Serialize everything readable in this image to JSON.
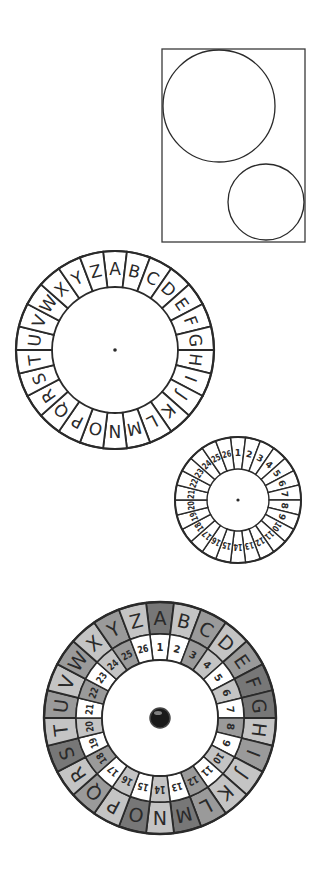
{
  "colors": {
    "ink": "#2a2a2a",
    "background": "#ffffff",
    "shade_light": "#c4c4c4",
    "shade_mid": "#9a9a9a",
    "shade_dark": "#777777",
    "hub": "#ffffff"
  },
  "layout_guide": {
    "rect": {
      "x": 162,
      "y": 49,
      "w": 143,
      "h": 193
    },
    "large_circle": {
      "cx": 219,
      "cy": 106,
      "r": 56
    },
    "small_circle": {
      "cx": 266,
      "cy": 202,
      "r": 38
    }
  },
  "letter_wheel": {
    "cx": 115,
    "cy": 350,
    "r_outer": 99,
    "r_inner": 63,
    "center_dot": true,
    "labels": [
      "A",
      "B",
      "C",
      "D",
      "E",
      "F",
      "G",
      "H",
      "I",
      "J",
      "K",
      "L",
      "M",
      "N",
      "O",
      "P",
      "Q",
      "R",
      "S",
      "T",
      "U",
      "V",
      "W",
      "X",
      "Y",
      "Z"
    ]
  },
  "number_wheel": {
    "cx": 238,
    "cy": 500,
    "r_outer": 63,
    "r_inner": 31,
    "center_dot": true,
    "labels": [
      "1",
      "2",
      "3",
      "4",
      "5",
      "6",
      "7",
      "8",
      "9",
      "10",
      "11",
      "12",
      "13",
      "14",
      "15",
      "16",
      "17",
      "18",
      "19",
      "20",
      "21",
      "22",
      "23",
      "24",
      "25",
      "26"
    ]
  },
  "assembled_wheel": {
    "cx": 160,
    "cy": 718,
    "outer": {
      "r_outer": 116,
      "r_inner": 84,
      "labels": [
        "A",
        "B",
        "C",
        "D",
        "E",
        "F",
        "G",
        "H",
        "I",
        "J",
        "K",
        "L",
        "M",
        "N",
        "O",
        "P",
        "Q",
        "R",
        "S",
        "T",
        "U",
        "V",
        "W",
        "X",
        "Y",
        "Z"
      ]
    },
    "inner": {
      "r_outer": 84,
      "r_inner": 58,
      "labels": [
        "1",
        "2",
        "3",
        "4",
        "5",
        "6",
        "7",
        "8",
        "9",
        "10",
        "11",
        "12",
        "13",
        "14",
        "15",
        "16",
        "17",
        "18",
        "19",
        "20",
        "21",
        "22",
        "23",
        "24",
        "25",
        "26"
      ]
    },
    "hub_radius": 58,
    "pin_radius": 10,
    "outer_shades": [
      "dark",
      "light",
      "mid",
      "light",
      "mid",
      "dark",
      "dark",
      "light",
      "mid",
      "light",
      "light",
      "mid",
      "dark",
      "light",
      "dark",
      "light",
      "mid",
      "light",
      "dark",
      "light",
      "mid",
      "light",
      "mid",
      "light",
      "mid",
      "light"
    ],
    "inner_shades": [
      "white",
      "white",
      "mid",
      "light",
      "white",
      "light",
      "white",
      "mid",
      "white",
      "light",
      "white",
      "mid",
      "white",
      "light",
      "white",
      "light",
      "white",
      "mid",
      "white",
      "light",
      "white",
      "mid",
      "white",
      "light",
      "mid",
      "white"
    ]
  }
}
